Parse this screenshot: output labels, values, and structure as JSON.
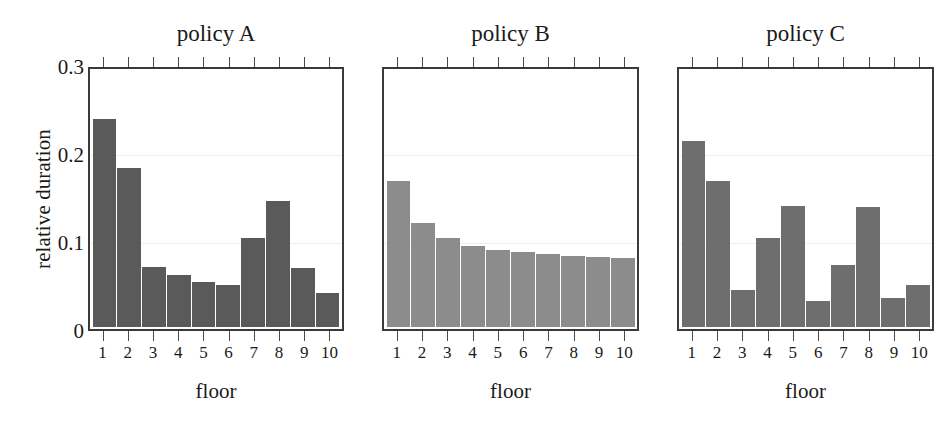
{
  "figure": {
    "ylabel": "relative duration",
    "xlabel": "floor",
    "y_ticks": [
      "0.3",
      "0.2",
      "0.1",
      "0"
    ],
    "y_tick_values": [
      0.3,
      0.2,
      0.1,
      0
    ],
    "x_tick_labels": [
      "1",
      "2",
      "3",
      "4",
      "5",
      "6",
      "7",
      "8",
      "9",
      "10"
    ]
  },
  "panels": [
    {
      "title": "policy A",
      "color": "#5a5a5a"
    },
    {
      "title": "policy B",
      "color": "#8c8c8c"
    },
    {
      "title": "policy C",
      "color": "#6e6e6e"
    }
  ],
  "chart_data": [
    {
      "type": "bar",
      "title": "policy A",
      "xlabel": "floor",
      "ylabel": "relative duration",
      "categories": [
        "1",
        "2",
        "3",
        "4",
        "5",
        "6",
        "7",
        "8",
        "9",
        "10"
      ],
      "values": [
        0.24,
        0.183,
        0.069,
        0.06,
        0.052,
        0.048,
        0.103,
        0.145,
        0.068,
        0.039
      ],
      "ylim": [
        0,
        0.3
      ],
      "yticks": [
        0,
        0.1,
        0.2,
        0.3
      ],
      "grid": false,
      "legend": "none",
      "bar_color": "#5a5a5a"
    },
    {
      "type": "bar",
      "title": "policy B",
      "xlabel": "floor",
      "ylabel": "relative duration",
      "categories": [
        "1",
        "2",
        "3",
        "4",
        "5",
        "6",
        "7",
        "8",
        "9",
        "10"
      ],
      "values": [
        0.168,
        0.12,
        0.103,
        0.094,
        0.089,
        0.086,
        0.084,
        0.082,
        0.081,
        0.08
      ],
      "ylim": [
        0,
        0.3
      ],
      "yticks": [
        0,
        0.1,
        0.2,
        0.3
      ],
      "grid": false,
      "legend": "none",
      "bar_color": "#8c8c8c"
    },
    {
      "type": "bar",
      "title": "policy C",
      "xlabel": "floor",
      "ylabel": "relative duration",
      "categories": [
        "1",
        "2",
        "3",
        "4",
        "5",
        "6",
        "7",
        "8",
        "9",
        "10"
      ],
      "values": [
        0.215,
        0.168,
        0.043,
        0.103,
        0.14,
        0.03,
        0.071,
        0.139,
        0.034,
        0.048
      ],
      "ylim": [
        0,
        0.3
      ],
      "yticks": [
        0,
        0.1,
        0.2,
        0.3
      ],
      "grid": false,
      "legend": "none",
      "bar_color": "#6e6e6e"
    }
  ]
}
